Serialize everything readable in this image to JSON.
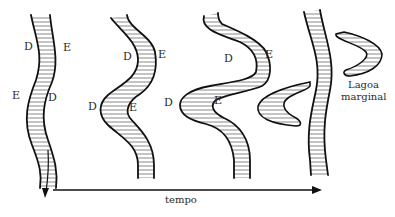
{
  "diagram": {
    "type": "meander-evolution",
    "stages": [
      {
        "id": 1,
        "labels": [
          {
            "text": "D"
          },
          {
            "text": "E"
          },
          {
            "text": "E"
          },
          {
            "text": "D"
          }
        ],
        "flow_arrow": true
      },
      {
        "id": 2,
        "labels": [
          {
            "text": "D"
          },
          {
            "text": "E"
          },
          {
            "text": "D"
          },
          {
            "text": "E"
          }
        ]
      },
      {
        "id": 3,
        "labels": [
          {
            "text": "D"
          },
          {
            "text": "E"
          },
          {
            "text": "D"
          },
          {
            "text": "E"
          }
        ]
      },
      {
        "id": 4,
        "labels": [],
        "oxbow_label_line1": "Lagoa",
        "oxbow_label_line2": "marginal"
      }
    ],
    "time_axis": {
      "label": "tempo",
      "direction": "right"
    },
    "colors": {
      "line": "#111111",
      "hatch": "#555555",
      "text": "#2a2a2a",
      "background": "#ffffff"
    }
  }
}
